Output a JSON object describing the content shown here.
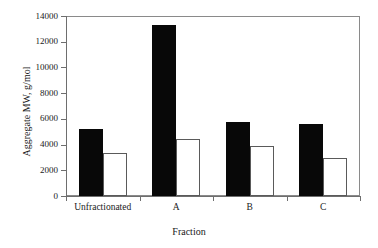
{
  "chart_data": {
    "type": "bar",
    "title": "",
    "xlabel": "Fraction",
    "ylabel": "Aggregate MW, g/mol",
    "categories": [
      "Unfractionated",
      "A",
      "B",
      "C"
    ],
    "series": [
      {
        "name": "filled",
        "values": [
          5180,
          13300,
          5720,
          5630
        ]
      },
      {
        "name": "open",
        "values": [
          3350,
          4450,
          3880,
          2950
        ]
      }
    ],
    "ylim": [
      0,
      14000
    ],
    "ytick_labels": [
      "0",
      "2000",
      "4000",
      "6000",
      "8000",
      "10000",
      "12000",
      "14000"
    ],
    "ytick_values": [
      0,
      2000,
      4000,
      6000,
      8000,
      10000,
      12000,
      14000
    ],
    "grid": false,
    "legend": "none",
    "colors": {
      "filled_bar": "#080808",
      "open_bar_fill": "#ffffff",
      "open_bar_edge": "#5a5a5a",
      "axis": "#6e6e6e",
      "text": "#1a1a1a",
      "background": "#ffffff"
    }
  }
}
